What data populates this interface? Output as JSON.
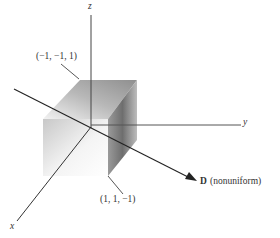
{
  "diagram": {
    "type": "3d-coordinate-diagram",
    "axes": {
      "x_label": "x",
      "y_label": "y",
      "z_label": "z"
    },
    "cube": {
      "corner_top_label": "(−1, −1, 1)",
      "corner_bottom_label": "(1, 1, −1)"
    },
    "vector": {
      "symbol": "D",
      "note": "(nonuniform)"
    },
    "colors": {
      "line": "#333333",
      "background": "#ffffff"
    }
  }
}
